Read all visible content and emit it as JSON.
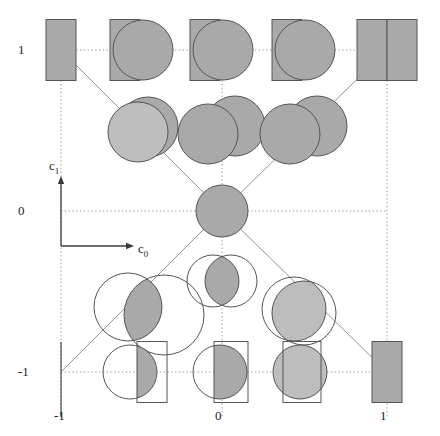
{
  "figure": {
    "domain_type": "diagram",
    "background_color": "#ffffff",
    "fill_color": "#a9a9a9",
    "fill_color_light": "#bdbdbd",
    "stroke_color": "#555555",
    "grid_color": "#9a9a9a",
    "diagonal_color": "#8a8a8a",
    "axis_color": "#3a3a3a"
  },
  "axes": {
    "x_axis_label": "c",
    "x_axis_sub": "0",
    "y_axis_label": "c",
    "y_axis_sub": "1",
    "x_range": [
      -1,
      1
    ],
    "y_range": [
      -1,
      1
    ],
    "x_ticks": [
      {
        "value": -1,
        "label": "-1",
        "px": 61
      },
      {
        "value": 0,
        "label": "0",
        "px": 222
      },
      {
        "value": 1,
        "label": "1",
        "px": 387
      }
    ],
    "y_ticks": [
      {
        "value": 1,
        "label": "1",
        "px": 50
      },
      {
        "value": 0,
        "label": "0",
        "px": 211
      },
      {
        "value": -1,
        "label": "-1",
        "px": 372
      }
    ],
    "origin_marker_px": {
      "x": 61,
      "y": 246
    },
    "arrow_x_tip_px": {
      "x": 129,
      "y": 246
    },
    "arrow_y_tip_px": {
      "x": 61,
      "y": 181
    }
  },
  "grid": {
    "dotted_horizontal_rows_px": [
      50,
      211,
      372
    ],
    "dotted_vertical_cols_px": [
      61,
      222,
      387
    ],
    "columns_px": [
      61,
      142,
      222,
      304,
      387
    ],
    "rows_px": [
      50,
      130,
      211,
      291,
      372
    ],
    "diagonals": [
      {
        "from_px": [
          61,
          50
        ],
        "to_px": [
          222,
          211
        ]
      },
      {
        "from_px": [
          222,
          211
        ],
        "to_px": [
          387,
          50
        ]
      },
      {
        "from_px": [
          61,
          372
        ],
        "to_px": [
          222,
          211
        ]
      },
      {
        "from_px": [
          222,
          211
        ],
        "to_px": [
          387,
          372
        ]
      }
    ]
  },
  "nodes": [
    {
      "name": "node-m1-p1",
      "c0": -1,
      "c1": 1,
      "cx": 61,
      "cy": 50,
      "glyph": "rect-filled",
      "label": "filled rectangle"
    },
    {
      "name": "node-m05-p1",
      "c0": -0.5,
      "c1": 1,
      "cx": 142,
      "cy": 50,
      "glyph": "rect-filled-circle-filled",
      "label": "filled rectangle with filled circle"
    },
    {
      "name": "node-0-p1",
      "c0": 0,
      "c1": 1,
      "cx": 222,
      "cy": 50,
      "glyph": "rect-filled-circle-filled",
      "label": "filled rectangle with filled circle"
    },
    {
      "name": "node-p05-p1",
      "c0": 0.5,
      "c1": 1,
      "cx": 304,
      "cy": 50,
      "glyph": "rect-filled-circle-filled",
      "label": "filled rectangle with filled circle"
    },
    {
      "name": "node-p1-p1",
      "c0": 1,
      "c1": 1,
      "cx": 387,
      "cy": 50,
      "glyph": "rect-double-filled",
      "label": "two adjacent filled rectangles"
    },
    {
      "name": "node-m05-p05",
      "c0": -0.5,
      "c1": 0.5,
      "cx": 142,
      "cy": 130,
      "glyph": "circle-pair-filled-tight",
      "label": "two filled circles, small offset"
    },
    {
      "name": "node-0-p05",
      "c0": 0,
      "c1": 0.5,
      "cx": 222,
      "cy": 130,
      "glyph": "circle-pair-filled-wide",
      "label": "two filled circles, wide offset"
    },
    {
      "name": "node-p05-p05",
      "c0": 0.5,
      "c1": 0.5,
      "cx": 304,
      "cy": 130,
      "glyph": "circle-pair-filled-wide",
      "label": "two filled circles, wide offset"
    },
    {
      "name": "node-0-0",
      "c0": 0,
      "c1": 0,
      "cx": 222,
      "cy": 211,
      "glyph": "circle-filled",
      "label": "single filled circle"
    },
    {
      "name": "node-0-m05",
      "c0": 0,
      "c1": -0.5,
      "cx": 222,
      "cy": 281,
      "glyph": "circle-pair-open-lens",
      "label": "two open circles with shaded lens"
    },
    {
      "name": "node-m05-m05",
      "c0": -0.5,
      "c1": -0.5,
      "cx": 150,
      "cy": 311,
      "glyph": "circle-pair-open-lens-wide",
      "label": "two large open circles with shaded lens"
    },
    {
      "name": "node-p05-m05",
      "c0": 0.5,
      "c1": -0.5,
      "cx": 300,
      "cy": 311,
      "glyph": "circle-pair-open-mostly-filled",
      "label": "two open circles, mostly shaded"
    },
    {
      "name": "node-m1-m1",
      "c0": -1,
      "c1": -1,
      "cx": 61,
      "cy": 372,
      "glyph": "empty",
      "label": "empty node"
    },
    {
      "name": "node-m05-m1",
      "c0": -0.5,
      "c1": -1,
      "cx": 142,
      "cy": 372,
      "glyph": "circle-open-rect-open-sliver",
      "label": "open circle and open rectangle, thin shaded sliver"
    },
    {
      "name": "node-0-m1",
      "c0": 0,
      "c1": -1,
      "cx": 222,
      "cy": 372,
      "glyph": "circle-open-rect-open-half",
      "label": "open circle and open rectangle, half shaded"
    },
    {
      "name": "node-p05-m1",
      "c0": 0.5,
      "c1": -1,
      "cx": 304,
      "cy": 372,
      "glyph": "circle-filled-rect-open",
      "label": "filled circle inside open rectangle"
    },
    {
      "name": "node-p1-m1",
      "c0": 1,
      "c1": -1,
      "cx": 387,
      "cy": 372,
      "glyph": "rect-filled",
      "label": "filled rectangle"
    }
  ]
}
